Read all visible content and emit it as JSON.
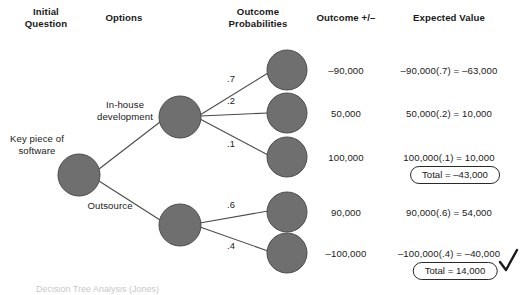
{
  "diagram": {
    "node_color": "#6f6f6f",
    "node_stroke": "#4d4d4d",
    "edge_color": "#4a4a4a",
    "text_color": "#1a1a1a"
  },
  "columns": [
    {
      "id": "initial-question",
      "line1": "Initial",
      "line2": "Question",
      "x": 46,
      "y": 6
    },
    {
      "id": "options",
      "line1": "Options",
      "line2": "",
      "x": 124,
      "y": 12
    },
    {
      "id": "outcome-probabilities",
      "line1": "Outcome",
      "line2": "Probabilities",
      "x": 258,
      "y": 6
    },
    {
      "id": "outcome-plus-minus",
      "line1": "Outcome +/–",
      "line2": "",
      "x": 346,
      "y": 12
    },
    {
      "id": "expected-value",
      "line1": "Expected Value",
      "line2": "",
      "x": 449,
      "y": 12
    }
  ],
  "root": {
    "label_line1": "Key piece of",
    "label_line2": "software",
    "label_x": 37,
    "label_y": 133,
    "node": {
      "cx": 79,
      "cy": 175,
      "r": 21
    }
  },
  "options": [
    {
      "id": "in-house-development",
      "label_line1": "In-house",
      "label_line2": "development",
      "label_x": 125,
      "label_y": 99,
      "node": {
        "cx": 180,
        "cy": 117,
        "r": 21
      }
    },
    {
      "id": "outsource",
      "label_line1": "Outsource",
      "label_line2": "",
      "label_x": 110,
      "label_y": 200,
      "node": {
        "cx": 180,
        "cy": 225,
        "r": 21
      }
    }
  ],
  "branches": [
    {
      "id": "in-house-p7",
      "parent": "in-house-development",
      "probability": ".7",
      "prob_x": 231,
      "prob_y": 73,
      "node": {
        "cx": 287,
        "cy": 70,
        "r": 20
      },
      "outcome": "–90,000",
      "outcome_x": 346,
      "outcome_y": 65,
      "expected_value": "–90,000(.7) = –63,000",
      "ev_x": 449,
      "ev_y": 65
    },
    {
      "id": "in-house-p2",
      "parent": "in-house-development",
      "probability": ".2",
      "prob_x": 231,
      "prob_y": 95,
      "node": {
        "cx": 287,
        "cy": 113,
        "r": 20
      },
      "outcome": "50,000",
      "outcome_x": 346,
      "outcome_y": 108,
      "expected_value": "50,000(.2) = 10,000",
      "ev_x": 449,
      "ev_y": 108
    },
    {
      "id": "in-house-p1",
      "parent": "in-house-development",
      "probability": ".1",
      "prob_x": 231,
      "prob_y": 138,
      "node": {
        "cx": 287,
        "cy": 157,
        "r": 20
      },
      "outcome": "100,000",
      "outcome_x": 346,
      "outcome_y": 152,
      "expected_value": "100,000(.1) = 10,000",
      "ev_x": 449,
      "ev_y": 152
    },
    {
      "id": "outsource-p6",
      "parent": "outsource",
      "probability": ".6",
      "prob_x": 231,
      "prob_y": 199,
      "node": {
        "cx": 287,
        "cy": 212,
        "r": 20
      },
      "outcome": "90,000",
      "outcome_x": 346,
      "outcome_y": 207,
      "expected_value": "90,000(.6) = 54,000",
      "ev_x": 449,
      "ev_y": 207
    },
    {
      "id": "outsource-p4",
      "parent": "outsource",
      "probability": ".4",
      "prob_x": 231,
      "prob_y": 240,
      "node": {
        "cx": 287,
        "cy": 253,
        "r": 20
      },
      "outcome": "–100,000",
      "outcome_x": 346,
      "outcome_y": 248,
      "expected_value": "–100,000(.4) = –40,000",
      "ev_x": 449,
      "ev_y": 248
    }
  ],
  "totals": [
    {
      "id": "total-in-house",
      "text": "Total = –43,000",
      "x": 455,
      "y": 166,
      "selected": false
    },
    {
      "id": "total-outsource",
      "text": "Total = 14,000",
      "x": 455,
      "y": 262,
      "selected": true
    }
  ],
  "selection": {
    "icon": "check-mark-icon",
    "x": 499,
    "y": 253,
    "color": "#1a1a1a"
  },
  "caption": {
    "text": "Decision Tree Analysis (Jones)"
  }
}
